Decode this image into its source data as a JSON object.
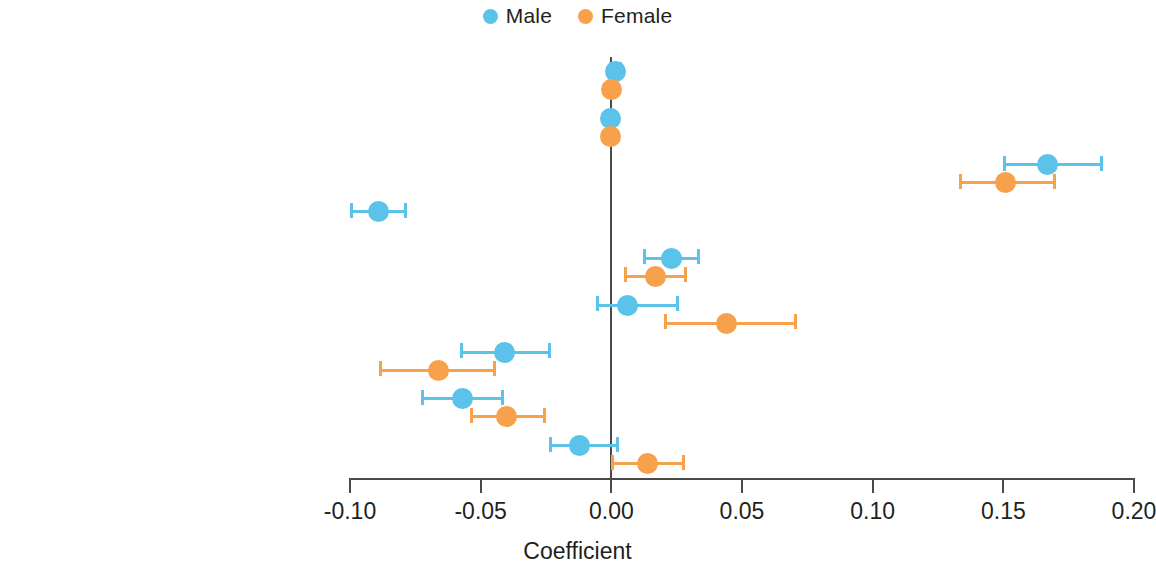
{
  "chart_data": {
    "type": "scatter",
    "title": "",
    "xlabel": "Coefficient",
    "ylabel": "",
    "xlim": [
      -0.115,
      0.2
    ],
    "xticks": [
      -0.1,
      -0.05,
      0.0,
      0.05,
      0.1,
      0.15,
      0.2
    ],
    "xtick_labels": [
      "-0.10",
      "-0.05",
      "0.00",
      "0.05",
      "0.10",
      "0.15",
      "0.20"
    ],
    "grid": false,
    "zero_reference_line": 0.0,
    "legend_position": "top-center",
    "categories": [
      "Age",
      "Age squared",
      "ADL impairment",
      "Self-assessed health",
      "Multiple NCDs",
      "Smoking",
      "Secondary education and above",
      "Married",
      "Rural"
    ],
    "series": [
      {
        "name": "Male",
        "color": "#5bc2ea",
        "values": [
          0.0015,
          -0.0005,
          0.167,
          -0.089,
          0.023,
          0.006,
          -0.041,
          -0.057,
          -0.012
        ],
        "ci_lower": [
          -0.001,
          -0.002,
          0.15,
          -0.1,
          0.012,
          -0.006,
          -0.058,
          -0.073,
          -0.024
        ],
        "ci_upper": [
          0.004,
          0.001,
          0.188,
          -0.078,
          0.034,
          0.026,
          -0.023,
          -0.041,
          0.003
        ]
      },
      {
        "name": "Female",
        "color": "#f7a14c",
        "values": [
          0.0,
          -0.0005,
          0.151,
          null,
          0.017,
          0.044,
          -0.066,
          -0.04,
          0.014
        ],
        "ci_lower": [
          -0.002,
          -0.002,
          0.133,
          null,
          0.005,
          0.02,
          -0.089,
          -0.054,
          0.0
        ],
        "ci_upper": [
          0.002,
          0.001,
          0.17,
          null,
          0.029,
          0.071,
          -0.044,
          -0.025,
          0.028
        ]
      }
    ]
  },
  "legend": {
    "items": [
      {
        "label": "Male",
        "color": "#5bc2ea"
      },
      {
        "label": "Female",
        "color": "#f7a14c"
      }
    ]
  },
  "axis": {
    "title": "Coefficient"
  }
}
